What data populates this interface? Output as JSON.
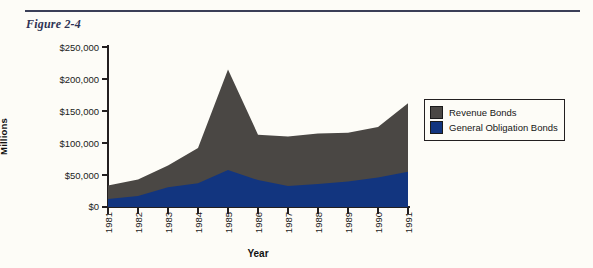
{
  "figure": {
    "title": "Figure 2-4"
  },
  "legend": {
    "position": "right",
    "items": [
      {
        "label": "Revenue Bonds",
        "color": "#4a4744"
      },
      {
        "label": "General Obligation Bonds",
        "color": "#12357f"
      }
    ]
  },
  "chart_data": {
    "type": "area",
    "stacked": true,
    "title": "Figure 2-4",
    "xlabel": "Year",
    "ylabel": "Millions",
    "grid": false,
    "legend_position": "right",
    "x": [
      1981,
      1982,
      1983,
      1984,
      1985,
      1986,
      1987,
      1988,
      1989,
      1990,
      1991
    ],
    "categories": [
      "1981",
      "1982",
      "1983",
      "1984",
      "1985",
      "1986",
      "1987",
      "1988",
      "1989",
      "1990",
      "1991"
    ],
    "ylim": [
      0,
      250000
    ],
    "yticks": [
      0,
      50000,
      100000,
      150000,
      200000,
      250000
    ],
    "ytick_labels": [
      "$0",
      "$50,000",
      "$100,000",
      "$150,000",
      "$200,000",
      "$250,000"
    ],
    "series": [
      {
        "name": "General Obligation Bonds",
        "color": "#12357f",
        "values": [
          12500,
          17000,
          31000,
          37000,
          58000,
          42000,
          33000,
          36000,
          40000,
          46000,
          55000
        ]
      },
      {
        "name": "Revenue Bonds",
        "color": "#4a4744",
        "values": [
          21000,
          26000,
          34000,
          55000,
          157000,
          71000,
          77000,
          79000,
          76000,
          79000,
          107000
        ]
      }
    ],
    "totals": [
      33500,
      43000,
      65000,
      92000,
      215000,
      113000,
      110000,
      115000,
      116000,
      125000,
      162000
    ]
  }
}
